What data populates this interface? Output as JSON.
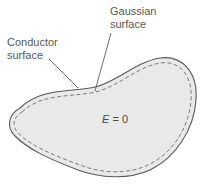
{
  "labels": {
    "gaussian": {
      "line1": "Gaussian",
      "line2": "surface"
    },
    "conductor": {
      "line1": "Conductor",
      "line2": "surface"
    }
  },
  "interior": {
    "variable": "E",
    "relation": " = 0"
  },
  "colors": {
    "conductor_fill": "#e9e9e9",
    "conductor_outline": "#5a5a5a",
    "gaussian_dash": "#7a7a7a",
    "leader_line": "#4a4a4a",
    "text": "#5a5a5a"
  }
}
